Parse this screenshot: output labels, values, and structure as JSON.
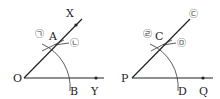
{
  "figures": [
    {
      "name": "construction-source",
      "vertex": "O",
      "ray_upper_end": "X",
      "ray_lower_end": "Y",
      "arc_point_upper": "A",
      "arc_point_lower": "B",
      "step_marks": [
        "㉠",
        "㉡"
      ]
    },
    {
      "name": "construction-copy",
      "vertex": "P",
      "ray_upper_end_mark": "㉢",
      "ray_lower_end": "Q",
      "arc_point_upper": "C",
      "arc_point_lower": "D",
      "step_marks": [
        "㉣",
        "㉤"
      ]
    }
  ],
  "colors": {
    "line": "#222222",
    "arc": "#333333",
    "background": "#ffffff"
  }
}
